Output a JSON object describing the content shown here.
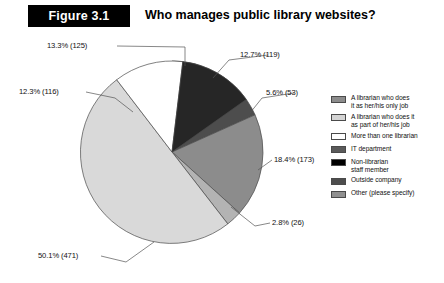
{
  "figure": {
    "badge": "Figure 3.1",
    "title": "Who manages public library websites?"
  },
  "chart_data": {
    "type": "pie",
    "title": "Who manages public library websites?",
    "xlabel": "",
    "ylabel": "",
    "total": 1083,
    "legend_position": "right",
    "grid": false,
    "start_angle_deg": 0,
    "direction": "clockwise",
    "categories": [
      "A librarian who does it as her/his only job",
      "A librarian who does it as part of her/his job",
      "More than one librarian",
      "IT department",
      "Non-librarian staff member",
      "Outside company",
      "Other (please specify)"
    ],
    "values": [
      12.7,
      50.1,
      12.3,
      18.4,
      13.3,
      5.6,
      2.8
    ],
    "counts": [
      119,
      471,
      116,
      173,
      125,
      53,
      26
    ],
    "colors": [
      "#8c8c8c",
      "#d9d9d9",
      "#ffffff",
      "#737373",
      "#000000",
      "#4d4d4d",
      "#999999"
    ],
    "slices": [
      {
        "label": "IT department",
        "percent": 12.7,
        "count": 119,
        "data_label": "12.7% (119)",
        "color": "#000000"
      },
      {
        "label": "Outside company",
        "percent": 5.6,
        "count": 53,
        "data_label": "5.6% (53)",
        "color": "#4d4d4d"
      },
      {
        "label": "A librarian who does it as her/his only job",
        "percent": 18.4,
        "count": 173,
        "data_label": "18.4% (173)",
        "color": "#8c8c8c"
      },
      {
        "label": "Other (please specify)",
        "percent": 2.8,
        "count": 26,
        "data_label": "2.8% (26)",
        "color": "#b3b3b3"
      },
      {
        "label": "A librarian who does it as part of her/his job",
        "percent": 50.1,
        "count": 471,
        "data_label": "50.1% (471)",
        "color": "#d9d9d9"
      },
      {
        "label": "More than one librarian",
        "percent": 12.3,
        "count": 116,
        "data_label": "12.3% (116)",
        "color": "#ffffff"
      },
      {
        "label": "Non-librarian staff member",
        "percent": 13.3,
        "count": 125,
        "data_label": "13.3% (125)",
        "color": "#262626"
      }
    ]
  },
  "legend": {
    "items": [
      {
        "label": "A librarian who does\nit as her/his only job",
        "color": "#8c8c8c"
      },
      {
        "label": "A librarian who does it\nas part of her/his job",
        "color": "#d4d4d4"
      },
      {
        "label": "More than one librarian",
        "color": "#ffffff"
      },
      {
        "label": "IT department",
        "color": "#5a5a5a"
      },
      {
        "label": "Non-librarian\nstaff member",
        "color": "#000000"
      },
      {
        "label": "Outside company",
        "color": "#4d4d4d"
      },
      {
        "label": "Other (please specify)",
        "color": "#909090"
      }
    ]
  }
}
